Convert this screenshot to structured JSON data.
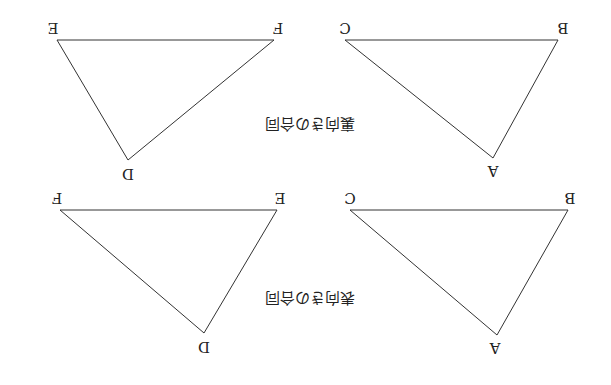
{
  "figure": {
    "rotation_deg": 180,
    "line_color": "#333333",
    "captions": {
      "top": "裏向きの合同",
      "bottom": "表向きの合同"
    },
    "triangles": {
      "top_right": {
        "v1": "A",
        "v2": "B",
        "v3": "C"
      },
      "top_left": {
        "v1": "D",
        "v2": "F",
        "v3": "E"
      },
      "bottom_right": {
        "v1": "A",
        "v2": "B",
        "v3": "C"
      },
      "bottom_left": {
        "v1": "D",
        "v2": "E",
        "v3": "F"
      }
    }
  }
}
